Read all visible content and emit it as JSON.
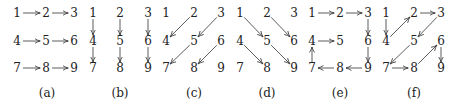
{
  "diagram": {
    "type": "grid-traversal-orderings",
    "grid": [
      [
        "1",
        "2",
        "3"
      ],
      [
        "4",
        "5",
        "6"
      ],
      [
        "7",
        "8",
        "9"
      ]
    ],
    "row_y": [
      17,
      45,
      72
    ],
    "label_y": 97,
    "panels": [
      {
        "id": "a",
        "label": "(a)",
        "cols_x": [
          17,
          46,
          74
        ],
        "label_x": 47,
        "description": "row-major horizontal",
        "edges": [
          [
            "1",
            "2"
          ],
          [
            "2",
            "3"
          ],
          [
            "4",
            "5"
          ],
          [
            "5",
            "6"
          ],
          [
            "7",
            "8"
          ],
          [
            "8",
            "9"
          ]
        ]
      },
      {
        "id": "b",
        "label": "(b)",
        "cols_x": [
          93,
          120,
          148
        ],
        "label_x": 120,
        "description": "column-major vertical",
        "edges": [
          [
            "1",
            "4"
          ],
          [
            "4",
            "7"
          ],
          [
            "2",
            "5"
          ],
          [
            "5",
            "8"
          ],
          [
            "3",
            "6"
          ],
          [
            "6",
            "9"
          ]
        ]
      },
      {
        "id": "c",
        "label": "(c)",
        "cols_x": [
          166,
          194,
          221
        ],
        "label_x": 194,
        "description": "anti-diagonal",
        "edges": [
          [
            "2",
            "4"
          ],
          [
            "3",
            "5"
          ],
          [
            "5",
            "7"
          ],
          [
            "6",
            "8"
          ]
        ]
      },
      {
        "id": "d",
        "label": "(d)",
        "cols_x": [
          240,
          267,
          294
        ],
        "label_x": 267,
        "description": "main-diagonal",
        "edges": [
          [
            "1",
            "5"
          ],
          [
            "2",
            "6"
          ],
          [
            "4",
            "8"
          ],
          [
            "5",
            "9"
          ]
        ]
      },
      {
        "id": "e",
        "label": "(e)",
        "cols_x": [
          312,
          340,
          368
        ],
        "label_x": 340,
        "description": "spiral",
        "edges": [
          [
            "1",
            "2"
          ],
          [
            "2",
            "3"
          ],
          [
            "3",
            "6"
          ],
          [
            "6",
            "9"
          ],
          [
            "9",
            "8"
          ],
          [
            "8",
            "7"
          ],
          [
            "7",
            "4"
          ],
          [
            "4",
            "5"
          ]
        ]
      },
      {
        "id": "f",
        "label": "(f)",
        "cols_x": [
          386,
          414,
          441
        ],
        "label_x": 414,
        "description": "zigzag",
        "edges": [
          [
            "1",
            "4"
          ],
          [
            "4",
            "2"
          ],
          [
            "2",
            "3"
          ],
          [
            "3",
            "5"
          ],
          [
            "5",
            "7"
          ],
          [
            "7",
            "8"
          ],
          [
            "8",
            "6"
          ],
          [
            "6",
            "9"
          ]
        ]
      }
    ]
  }
}
